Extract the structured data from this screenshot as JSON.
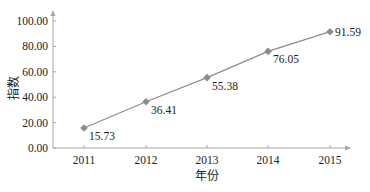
{
  "chart_data": {
    "type": "line",
    "title": "",
    "xlabel": "年份",
    "ylabel": "指数",
    "categories": [
      "2011",
      "2012",
      "2013",
      "2014",
      "2015"
    ],
    "series": [
      {
        "name": "指数",
        "values": [
          15.73,
          36.41,
          55.38,
          76.05,
          91.59
        ],
        "color": "#8c8c8c",
        "marker": "diamond"
      }
    ],
    "data_labels": [
      "15.73",
      "36.41",
      "55.38",
      "76.05",
      "91.59"
    ],
    "yticks": [
      "0.00",
      "20.00",
      "40.00",
      "60.00",
      "80.00",
      "100.00"
    ],
    "ylim": [
      0,
      100
    ],
    "grid": false,
    "legend": "none"
  },
  "colors": {
    "axis": "#a6a6a6",
    "line": "#8c8c8c",
    "marker": "#8c8c8c",
    "text": "#222222"
  }
}
